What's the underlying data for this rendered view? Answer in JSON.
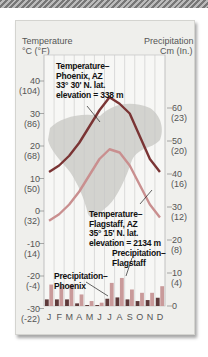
{
  "chart_data": {
    "type": "line+bar",
    "title": "",
    "left_axis": {
      "label_line1": "Temperature",
      "label_line2": "°C (°F)",
      "ticks": [
        {
          "c": 40,
          "label": "40",
          "sub": "(104)"
        },
        {
          "c": 30,
          "label": "30",
          "sub": "(86)"
        },
        {
          "c": 20,
          "label": "20",
          "sub": "(68)"
        },
        {
          "c": 10,
          "label": "10",
          "sub": "(50)"
        },
        {
          "c": 0,
          "label": "0",
          "sub": "(32)"
        },
        {
          "c": -10,
          "label": "-10",
          "sub": "(14)"
        },
        {
          "c": -20,
          "label": "-20",
          "sub": "(-4)"
        },
        {
          "c": -30,
          "label": "-30",
          "sub": "(-22)"
        }
      ],
      "range": [
        -30,
        47
      ]
    },
    "right_axis": {
      "label_line1": "Precipitation",
      "label_line2": "Cm (In.)",
      "ticks": [
        {
          "v": 60,
          "label": "60",
          "sub": "(23)"
        },
        {
          "v": 50,
          "label": "50",
          "sub": "(20)"
        },
        {
          "v": 40,
          "label": "40",
          "sub": "(16)"
        },
        {
          "v": 30,
          "label": "30",
          "sub": "(12)"
        },
        {
          "v": 20,
          "label": "20",
          "sub": "(8)"
        },
        {
          "v": 10,
          "label": "10",
          "sub": "(4)"
        },
        {
          "v": 0,
          "label": "0",
          "sub": ""
        }
      ],
      "range": [
        0,
        77
      ]
    },
    "categories": [
      "J",
      "F",
      "M",
      "A",
      "M",
      "J",
      "J",
      "A",
      "S",
      "O",
      "N",
      "D"
    ],
    "series": [
      {
        "name": "Temperature–Phoenix, AZ",
        "kind": "line",
        "axis": "left",
        "color": "#7a3434",
        "values": [
          12,
          14,
          17,
          21,
          26,
          31,
          35,
          33,
          30,
          23,
          16,
          12
        ]
      },
      {
        "name": "Temperature–Flagstaff, AZ",
        "kind": "line",
        "axis": "left",
        "color": "#c98f8f",
        "values": [
          -3,
          -1,
          2,
          6,
          11,
          16,
          19,
          18,
          14,
          8,
          2,
          -2
        ]
      },
      {
        "name": "Precipitation–Phoenix",
        "kind": "bar",
        "axis": "right",
        "color": "#5e3a3a",
        "values": [
          2,
          2,
          2,
          0.8,
          0.3,
          0.3,
          2.2,
          2.6,
          2,
          1.5,
          1.8,
          2.5
        ]
      },
      {
        "name": "Precipitation–Flagstaff",
        "kind": "bar",
        "axis": "right",
        "color": "#c99a9a",
        "values": [
          6.5,
          6,
          6.5,
          3.5,
          1.5,
          1,
          7,
          8.5,
          5,
          4,
          4,
          6
        ]
      }
    ],
    "annotations": [
      {
        "id": "phx_temp",
        "text": "Temperature–\nPhoenix, AZ\n33° 30' N. lat.\nelevation = 338 m"
      },
      {
        "id": "flg_temp",
        "text": "Temperature–\nFlagstaff, AZ\n35° 15' N. lat.\nelevation = 2134 m"
      },
      {
        "id": "flg_prec",
        "text": "Precipitation–\nFlagstaff"
      },
      {
        "id": "phx_prec",
        "text": "Precipitation–\nPhoenix"
      }
    ],
    "background": "map of North America (decorative)",
    "grid": "vertical lines per month"
  }
}
